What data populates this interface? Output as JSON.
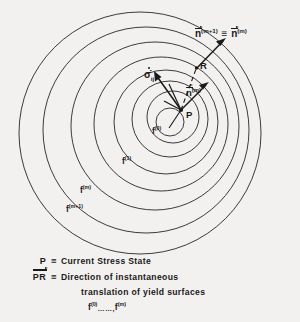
{
  "figure": {
    "background_color": "#f2f1ef",
    "line_color": "#1a1a1a",
    "points": [
      {
        "id": "P",
        "label": "P",
        "x": 181,
        "y": 110,
        "description": "current stress state on yield surfaces"
      },
      {
        "id": "R",
        "label": "R",
        "x": 197,
        "y": 67,
        "description": "target point for translation direction"
      }
    ],
    "vectors": [
      {
        "id": "sigma-dot",
        "label": "σ̇",
        "subscript": "ij",
        "from": "P",
        "angle_deg": 118,
        "length": 46
      },
      {
        "id": "n-m",
        "label": "n",
        "superscript": "(m)",
        "overbar": true,
        "from": "P",
        "angle_deg": 52,
        "length": 34
      },
      {
        "id": "n-m-plus-1",
        "label": "n",
        "superscript": "(m+1)",
        "overbar": true,
        "from": "R",
        "angle_deg": 42,
        "length": 40
      },
      {
        "id": "PR",
        "label": "PR",
        "from": "P",
        "to": "R",
        "style": "dashed"
      }
    ],
    "surface_labels": [
      {
        "id": "f0",
        "base": "f",
        "superscript": "(0)",
        "x": 156,
        "y": 130
      },
      {
        "id": "f1",
        "base": "f",
        "superscript": "(1)",
        "x": 126,
        "y": 160
      },
      {
        "id": "fm",
        "base": "f",
        "superscript": "(m)",
        "x": 84,
        "y": 189
      },
      {
        "id": "fm1",
        "base": "f",
        "superscript": "(m+1)",
        "x": 72,
        "y": 208
      }
    ],
    "vector_equation": {
      "left_base": "n",
      "left_sup": "(m+1)",
      "relation": "≡",
      "right_base": "n",
      "right_sup": "(m)"
    }
  },
  "legend": {
    "rows": [
      {
        "symbol": "P",
        "symbol_style": "plain",
        "relation": "≡",
        "text": "Current Stress State"
      },
      {
        "symbol": "PR",
        "symbol_style": "vector",
        "relation": "≡",
        "text": "Direction of instantaneous",
        "continuation": "translation of yield surfaces"
      }
    ],
    "surfaces_line": {
      "first_base": "f",
      "first_sup": "(0)",
      "dots": "……,",
      "last_base": "f",
      "last_sup": "(m)"
    }
  }
}
